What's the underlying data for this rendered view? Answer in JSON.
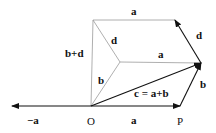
{
  "diagram": {
    "title": "",
    "points": {
      "O": {
        "x": 91,
        "y": 106,
        "label": "O"
      },
      "P": {
        "x": 180,
        "y": 106,
        "label": "P"
      },
      "neg_a_tip": {
        "x": 12,
        "y": 106
      },
      "c_tip": {
        "x": 201,
        "y": 63
      },
      "mid": {
        "x": 120,
        "y": 62
      },
      "top_left": {
        "x": 93,
        "y": 20
      },
      "top_right": {
        "x": 175,
        "y": 20
      }
    },
    "labels": {
      "neg_a": "−a",
      "O": "O",
      "a_bottom": "a",
      "P": "P",
      "c": "c = a+b",
      "b_right": "b",
      "b_left": "b",
      "a_middle": "a",
      "a_top": "a",
      "d_right": "d",
      "d_left": "d",
      "b_plus_d": "b+d"
    },
    "vectors": [
      {
        "name": "a",
        "from": "O",
        "to": "P"
      },
      {
        "name": "-a",
        "from": "O",
        "to": "neg_a_tip"
      },
      {
        "name": "b",
        "from": "P",
        "to": "c_tip"
      },
      {
        "name": "c",
        "from": "O",
        "to": "c_tip"
      },
      {
        "name": "d",
        "from": "c_tip",
        "to": "top_right"
      }
    ],
    "edges": [
      {
        "from": "O",
        "to": "mid",
        "label": "b"
      },
      {
        "from": "mid",
        "to": "c_tip",
        "label": "a"
      },
      {
        "from": "mid",
        "to": "top_left",
        "label": "d"
      },
      {
        "from": "top_left",
        "to": "top_right",
        "label": "a"
      },
      {
        "from": "O",
        "to": "top_left",
        "label": "b+d"
      }
    ]
  }
}
